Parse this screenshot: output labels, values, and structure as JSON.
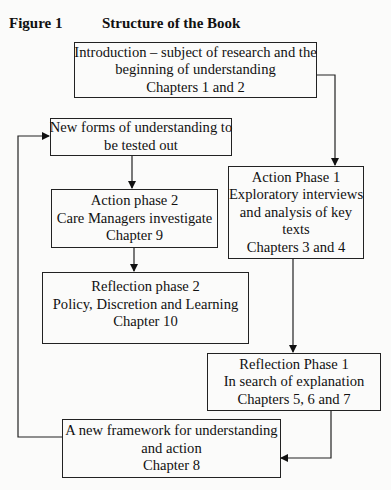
{
  "figure": {
    "label": "Figure 1",
    "title": "Structure of the Book"
  },
  "nodes": {
    "introduction": {
      "lines": [
        "Introduction – subject of research and the",
        "beginning of understanding",
        "Chapters 1 and 2"
      ]
    },
    "action_phase_1": {
      "lines": [
        "Action Phase 1",
        "Exploratory interviews",
        "and analysis of key",
        "texts",
        "Chapters 3 and 4"
      ]
    },
    "reflection_phase_1": {
      "lines": [
        "Reflection Phase 1",
        "In search of explanation",
        "Chapters 5, 6 and 7"
      ]
    },
    "new_framework": {
      "lines": [
        "A new framework for understanding",
        "and action",
        "Chapter 8"
      ]
    },
    "new_forms": {
      "lines": [
        "New forms of understanding to",
        "be tested out"
      ]
    },
    "action_phase_2": {
      "lines": [
        "Action phase 2",
        "Care Managers investigate",
        "Chapter 9"
      ]
    },
    "reflection_phase_2": {
      "lines": [
        "Reflection phase 2",
        "Policy, Discretion and Learning",
        "Chapter 10"
      ]
    }
  },
  "edges": [
    {
      "from": "introduction",
      "to": "action_phase_1"
    },
    {
      "from": "action_phase_1",
      "to": "reflection_phase_1"
    },
    {
      "from": "reflection_phase_1",
      "to": "new_framework"
    },
    {
      "from": "new_framework",
      "to": "new_forms"
    },
    {
      "from": "new_forms",
      "to": "action_phase_2"
    },
    {
      "from": "action_phase_2",
      "to": "reflection_phase_2"
    }
  ],
  "colors": {
    "line": "#222222",
    "background": "#fbfbfa"
  }
}
